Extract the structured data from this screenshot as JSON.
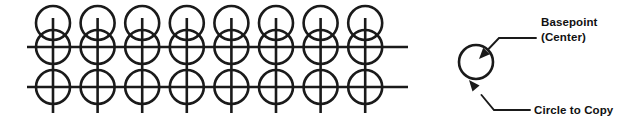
{
  "diagram": {
    "background_color": "#ffffff",
    "stroke_color": "#1a1a1a",
    "title": "",
    "array": {
      "columns": 8,
      "rows": 3,
      "circle_radius": 17,
      "column_spacing": 44.6,
      "first_column_x": 53,
      "row_centers_y": [
        23,
        47,
        87
      ],
      "horizontal_lines_y": [
        47,
        87
      ],
      "horizontal_line_start_x": 27,
      "horizontal_line_end_x": 408,
      "vertical_line_top_y": 18,
      "vertical_line_bottom_y": 113
    },
    "reference": {
      "circle": {
        "center_x": 476,
        "center_y": 62,
        "radius": 17
      },
      "basepoint_marker": {
        "arrow_tip_x": 478,
        "arrow_tip_y": 60
      }
    },
    "annotations": [
      {
        "id": "basepoint",
        "name": "basepoint-label",
        "line1": "Basepoint",
        "line2": "(Center)",
        "text_x": 541,
        "text_y": 26,
        "leader": {
          "elbow_x": 536,
          "elbow_y": 38,
          "bend_x": 499,
          "bend_y": 38,
          "tip_x": 479,
          "tip_y": 59
        }
      },
      {
        "id": "circle-to-copy",
        "name": "circle-to-copy-label",
        "line1": "Circle to Copy",
        "line2": "",
        "text_x": 534,
        "text_y": 114,
        "leader": {
          "elbow_x": 530,
          "elbow_y": 110,
          "bend_x": 494,
          "bend_y": 110,
          "tip_x": 469,
          "tip_y": 80
        }
      }
    ]
  }
}
